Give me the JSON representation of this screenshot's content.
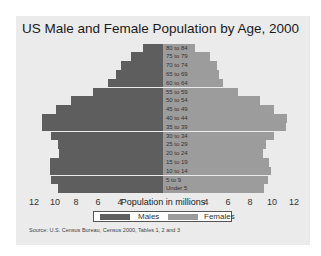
{
  "chart_data": {
    "type": "bar",
    "orientation": "horizontal",
    "subtype": "population-pyramid",
    "title": "US Male and Female Population by Age, 2000",
    "xlabel": "Population in millions",
    "ylabel": "",
    "categories": [
      "80 to 84",
      "75 to 79",
      "70 to 74",
      "65 to 69",
      "60 to 64",
      "55 to 59",
      "50 to 54",
      "45 to 49",
      "40 to 44",
      "35 to 39",
      "30 to 34",
      "25 to 29",
      "20 to 24",
      "15 to 19",
      "10 to 14",
      "5 to 9",
      "Under 5"
    ],
    "series": [
      {
        "name": "Males",
        "color": "#5e5e5e",
        "side": "left",
        "values": [
          1.9,
          3.0,
          3.9,
          4.4,
          5.1,
          6.5,
          8.6,
          10.0,
          11.3,
          11.3,
          10.4,
          9.8,
          9.7,
          10.5,
          10.5,
          10.4,
          9.8
        ]
      },
      {
        "name": "Females",
        "color": "#9c9c9c",
        "side": "right",
        "values": [
          3.0,
          4.4,
          5.0,
          5.2,
          5.6,
          7.0,
          9.0,
          10.3,
          11.5,
          11.4,
          10.3,
          9.6,
          9.3,
          9.9,
          10.0,
          9.8,
          9.4
        ]
      }
    ],
    "x_ticks_left": [
      "12",
      "10",
      "8",
      "6",
      "4"
    ],
    "x_ticks_right": [
      "4",
      "6",
      "8",
      "10",
      "12"
    ],
    "xlim": [
      -12,
      12
    ],
    "grid": false,
    "legend_position": "bottom",
    "annotations": [
      "Source:  U.S. Census Bureau, Census 2000, Tables 1, 2 and 3"
    ]
  },
  "legend": {
    "males": "Males",
    "females": "Females"
  },
  "source": "Source:  U.S. Census Bureau, Census 2000, Tables 1, 2 and 3"
}
